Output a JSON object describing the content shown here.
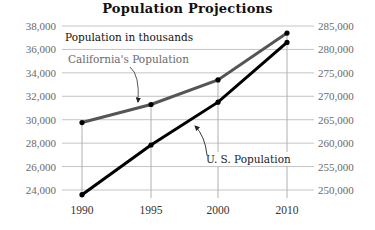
{
  "chart_data": {
    "type": "line",
    "title": "Population Projections",
    "subtitle": "Population in thousands",
    "xlabel": "",
    "ylabel_left": "California population (thousands)",
    "ylabel_right": "U.S. population (thousands)",
    "categories": [
      "1990",
      "1995",
      "2000",
      "2010"
    ],
    "series": [
      {
        "name": "California's Population",
        "axis": "left",
        "color": "#555555",
        "values": [
          29760,
          31300,
          33400,
          37400
        ]
      },
      {
        "name": "U. S. Population",
        "axis": "right",
        "color": "#000000",
        "values": [
          249000,
          259600,
          268750,
          281500
        ]
      }
    ],
    "ylim_left": [
      24000,
      38000
    ],
    "ylim_right": [
      250000,
      285000
    ],
    "left_ticks": [
      "38,000",
      "36,000",
      "34,000",
      "32,000",
      "30,000",
      "28,000",
      "26,000",
      "24,000"
    ],
    "right_ticks": [
      "285,000",
      "280,000",
      "275,000",
      "270,000",
      "265,000",
      "260,000",
      "255,000",
      "250,000"
    ],
    "grid": true,
    "legend": "inline annotations"
  },
  "labels": {
    "title": "Population Projections",
    "subtitle": "Population in thousands",
    "california": "California's Population",
    "us": "U. S. Population"
  }
}
